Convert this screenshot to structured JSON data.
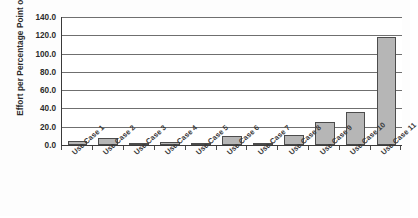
{
  "chart_data": {
    "type": "bar",
    "title": "",
    "subtitle": "",
    "xlabel": "",
    "ylabel": "Effort per Percentage Point of Use",
    "categories": [
      "Use Case 1",
      "Use Case 2",
      "Use Case 3",
      "Use Case 4",
      "Use Case 5",
      "Use Case 6",
      "Use Case 7",
      "Use Case 8",
      "Use Case 9",
      "Use Case 10",
      "Use Case 11"
    ],
    "values": [
      4.0,
      8.0,
      2.5,
      3.5,
      1.0,
      10.0,
      2.0,
      11.0,
      25.0,
      36.0,
      118.0
    ],
    "ylim": [
      0.0,
      140.0
    ],
    "ytick_values": [
      0.0,
      20.0,
      40.0,
      60.0,
      80.0,
      100.0,
      120.0,
      140.0
    ],
    "ytick_labels": [
      "0.0",
      "20.0",
      "40.0",
      "60.0",
      "80.0",
      "100.0",
      "120.0",
      "140.0"
    ],
    "grid": true,
    "grid_axis": "y",
    "legend": false,
    "legend_position": "none",
    "bar_fill_color": "#b6b6b6",
    "bar_border_color": "#4c4c4c",
    "gridline_color": "#6f6f6f",
    "axis_color": "#3a3a3a",
    "text_color": "#2b2b2b",
    "plot_background": "#ffffff",
    "figure_background": "#fdfdfd",
    "xtick_label_rotation": -42
  },
  "caption": {
    "bottom_text": ""
  }
}
